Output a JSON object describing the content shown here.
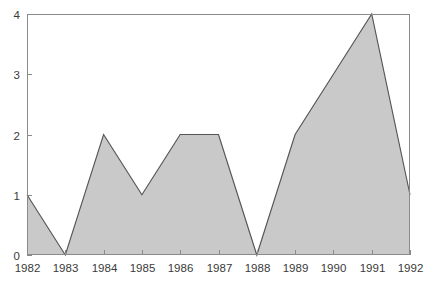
{
  "chart_data": {
    "type": "area",
    "title": "",
    "xlabel": "",
    "ylabel": "",
    "categories": [
      "1982",
      "1983",
      "1984",
      "1985",
      "1986",
      "1987",
      "1988",
      "1989",
      "1990",
      "1991",
      "1992"
    ],
    "values": [
      1,
      0,
      2,
      1,
      2,
      2,
      0,
      2,
      3,
      4,
      1
    ],
    "series": [
      {
        "name": "",
        "values": [
          1,
          0,
          2,
          1,
          2,
          2,
          0,
          2,
          3,
          4,
          1
        ]
      }
    ],
    "x_tick_labels": [
      "1982",
      "1983",
      "1984",
      "1985",
      "1986",
      "1987",
      "1988",
      "1989",
      "1990",
      "1991",
      "1992"
    ],
    "y_tick_labels": [
      "0",
      "1",
      "2",
      "3",
      "4"
    ],
    "y_tick_values": [
      0,
      1,
      2,
      3,
      4
    ],
    "ylim": [
      0,
      4
    ],
    "xlim": [
      "1982",
      "1992"
    ],
    "grid": false,
    "legend": false,
    "legend_position": "none",
    "annotations": []
  },
  "style": {
    "background_color": "#ffffff",
    "area_fill_color": "#c9c9c9",
    "area_outline_color": "#555555",
    "axis_color": "#8a8a8a",
    "label_color": "#3a3a3a"
  },
  "plot_geometry": {
    "left": 27,
    "right": 410,
    "top": 14,
    "bottom": 255
  }
}
